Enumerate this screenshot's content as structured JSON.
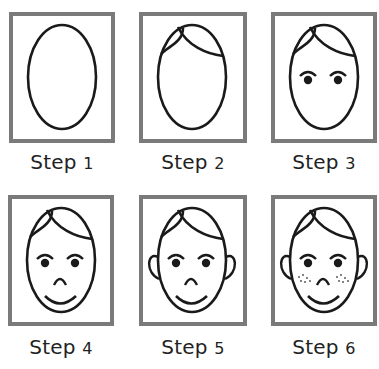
{
  "colors": {
    "frame_border": "#7a7a7a",
    "line": "#1a1a1a",
    "label_text": "#222222",
    "background": "#ffffff"
  },
  "steps": [
    {
      "index": 1,
      "word": "Step",
      "number": "1",
      "features": [
        "face-outline"
      ]
    },
    {
      "index": 2,
      "word": "Step",
      "number": "2",
      "features": [
        "face-outline",
        "hair"
      ]
    },
    {
      "index": 3,
      "word": "Step",
      "number": "3",
      "features": [
        "face-outline",
        "hair",
        "eyes",
        "eyebrows"
      ]
    },
    {
      "index": 4,
      "word": "Step",
      "number": "4",
      "features": [
        "face-outline",
        "hair",
        "eyes",
        "eyebrows",
        "nose",
        "mouth"
      ]
    },
    {
      "index": 5,
      "word": "Step",
      "number": "5",
      "features": [
        "face-outline",
        "hair",
        "eyes",
        "eyebrows",
        "nose",
        "mouth",
        "ears"
      ]
    },
    {
      "index": 6,
      "word": "Step",
      "number": "6",
      "features": [
        "face-outline",
        "hair",
        "eyes",
        "eyebrows",
        "nose",
        "mouth",
        "ears",
        "freckles"
      ]
    }
  ]
}
